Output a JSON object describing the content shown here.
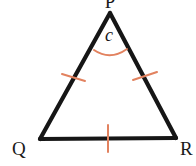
{
  "figure": {
    "type": "geometry-diagram",
    "shape": "triangle",
    "name": "Triangle PQR",
    "canvas": {
      "width": 196,
      "height": 166,
      "background": "#ffffff"
    },
    "colors": {
      "stroke": "#161616",
      "accent": "#e2825f",
      "label": "#1a1a1a",
      "background": "#ffffff"
    },
    "stroke_width": 4.2,
    "accent_stroke_width": 2.0
  },
  "vertices": [
    {
      "id": "P",
      "label": "P",
      "x": 110,
      "y": 13,
      "label_x": 104,
      "label_y": 8,
      "clipped_top": true
    },
    {
      "id": "Q",
      "label": "Q",
      "x": 40,
      "y": 139,
      "label_x": 12,
      "label_y": 155,
      "clipped_top": false
    },
    {
      "id": "R",
      "label": "R",
      "x": 176,
      "y": 138,
      "label_x": 180,
      "label_y": 155,
      "clipped_top": false
    }
  ],
  "sides": [
    {
      "id": "PQ",
      "from": "P",
      "to": "Q",
      "tick_count": 1,
      "tick_orientation": "horizontal"
    },
    {
      "id": "PR",
      "from": "P",
      "to": "R",
      "tick_count": 1,
      "tick_orientation": "horizontal"
    },
    {
      "id": "QR",
      "from": "Q",
      "to": "R",
      "tick_count": 1,
      "tick_orientation": "vertical"
    }
  ],
  "angle_marks": [
    {
      "id": "angle-P",
      "at_vertex": "P",
      "label": "c",
      "label_x": 109,
      "label_y": 41,
      "arc_path": "M 94 50 Q 110 61 127 49",
      "color": "#e2825f"
    }
  ],
  "tick_marks": [
    {
      "id": "tick-pq",
      "on_side": "PQ",
      "x1": 62,
      "y1": 74,
      "x2": 85,
      "y2": 81
    },
    {
      "id": "tick-pr",
      "on_side": "PR",
      "x1": 133,
      "y1": 80,
      "x2": 157,
      "y2": 72
    },
    {
      "id": "tick-qr",
      "on_side": "QR",
      "x1": 108,
      "y1": 125,
      "x2": 108,
      "y2": 152
    }
  ]
}
